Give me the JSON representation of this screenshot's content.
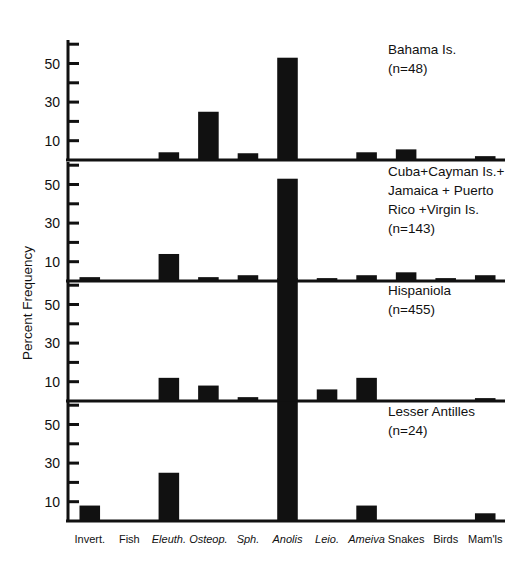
{
  "figure": {
    "ylabel": "Percent Frequency",
    "y_ticks_labeled": [
      "10",
      "30",
      "50"
    ],
    "y_tick_values": [
      10,
      20,
      30,
      40,
      50,
      60
    ],
    "y_tick_labels_map": {
      "10": "10",
      "20": "",
      "30": "30",
      "40": "",
      "50": "50",
      "60": ""
    }
  },
  "categories": [
    {
      "label": "Invert.",
      "italic": false
    },
    {
      "label": "Fish",
      "italic": false
    },
    {
      "label": "Eleuth.",
      "italic": true
    },
    {
      "label": "Osteop.",
      "italic": true
    },
    {
      "label": "Sph.",
      "italic": true
    },
    {
      "label": "Anolis",
      "italic": true
    },
    {
      "label": "Leio.",
      "italic": true
    },
    {
      "label": "Ameiva",
      "italic": true
    },
    {
      "label": "Snakes",
      "italic": false
    },
    {
      "label": "Birds",
      "italic": false
    },
    {
      "label": "Mam'ls",
      "italic": false
    }
  ],
  "panels": [
    {
      "caption_lines": [
        "Bahama Is.",
        "(n=48)"
      ],
      "n": 48,
      "values": [
        0,
        0,
        4,
        25,
        3.5,
        53,
        0,
        4,
        5.5,
        0,
        2
      ]
    },
    {
      "caption_lines": [
        "Cuba+Cayman Is.+",
        "Jamaica + Puerto",
        "Rico +Virgin Is.",
        "(n=143)"
      ],
      "n": 143,
      "values": [
        2,
        0,
        14,
        2,
        3,
        53,
        1.5,
        3,
        4.5,
        1.5,
        3
      ]
    },
    {
      "caption_lines": [
        "Hispaniola",
        "(n=455)"
      ],
      "n": 455,
      "values": [
        0,
        0,
        12,
        8,
        2,
        68,
        6,
        12,
        0,
        0,
        1.5
      ]
    },
    {
      "caption_lines": [
        "Lesser Antilles",
        "(n=24)"
      ],
      "n": 24,
      "values": [
        8,
        0,
        25,
        0,
        0,
        62,
        0,
        8,
        0,
        0,
        4
      ]
    }
  ],
  "chart_data": {
    "type": "bar",
    "title": "",
    "xlabel": "",
    "ylabel": "Percent Frequency",
    "ylim": [
      0,
      60
    ],
    "grid": false,
    "legend_position": "inside-top-right-per-panel",
    "categories": [
      "Invert.",
      "Fish",
      "Eleuth.",
      "Osteop.",
      "Sph.",
      "Anolis",
      "Leio.",
      "Ameiva",
      "Snakes",
      "Birds",
      "Mam'ls"
    ],
    "series": [
      {
        "name": "Bahama Is. (n=48)",
        "values": [
          0,
          0,
          4,
          25,
          3.5,
          53,
          0,
          4,
          5.5,
          0,
          2
        ]
      },
      {
        "name": "Cuba+Cayman Is.+Jamaica + Puerto Rico +Virgin Is. (n=143)",
        "values": [
          2,
          0,
          14,
          2,
          3,
          53,
          1.5,
          3,
          4.5,
          1.5,
          3
        ]
      },
      {
        "name": "Hispaniola (n=455)",
        "values": [
          0,
          0,
          12,
          8,
          2,
          68,
          6,
          12,
          0,
          0,
          1.5
        ]
      },
      {
        "name": "Lesser Antilles (n=24)",
        "values": [
          8,
          0,
          25,
          0,
          0,
          62,
          0,
          8,
          0,
          0,
          4
        ]
      }
    ]
  }
}
